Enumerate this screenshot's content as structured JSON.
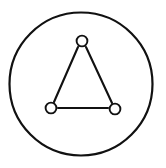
{
  "figure": {
    "background_color": "#ffffff",
    "stroke_color": "#111111",
    "fill_color": "#ffffff",
    "canvas": {
      "width": 166,
      "height": 168
    }
  },
  "chart_data": {
    "type": "scatter",
    "title": "",
    "xlabel": "",
    "ylabel": "",
    "xlim": [
      0,
      166
    ],
    "ylim": [
      0,
      168
    ],
    "grid": false,
    "legend": "none",
    "boundary": {
      "name": "enclosing-circle",
      "cx": 81,
      "cy": 84,
      "r": 71.5,
      "stroke_width": 2.2
    },
    "nodes": [
      {
        "id": "top",
        "label": "",
        "cx": 82,
        "cy": 41,
        "r": 5.4,
        "stroke_width": 1.9
      },
      {
        "id": "bottom-left",
        "label": "",
        "cx": 51,
        "cy": 108,
        "r": 5.4,
        "stroke_width": 1.9
      },
      {
        "id": "bottom-right",
        "label": "",
        "cx": 115,
        "cy": 109,
        "r": 5.4,
        "stroke_width": 1.9
      }
    ],
    "edges": [
      {
        "id": "bond-top-left",
        "from": "top",
        "to": "bottom-left",
        "x1": 78,
        "y1": 47,
        "x2": 54,
        "y2": 102,
        "stroke_width": 2.1
      },
      {
        "id": "bond-top-right",
        "from": "top",
        "to": "bottom-right",
        "x1": 86,
        "y1": 47,
        "x2": 112,
        "y2": 103,
        "stroke_width": 2.1
      },
      {
        "id": "bond-bottom",
        "from": "bottom-left",
        "to": "bottom-right",
        "x1": 58,
        "y1": 108,
        "x2": 108,
        "y2": 108,
        "stroke_width": 2.1
      }
    ]
  }
}
